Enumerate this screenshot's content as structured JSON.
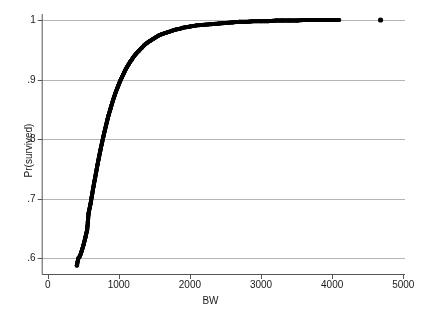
{
  "chart_data": {
    "type": "scatter",
    "title": "",
    "xlabel": "BW",
    "ylabel": "Pr(survived)",
    "xlim": [
      0,
      5000
    ],
    "ylim": [
      0.57,
      1.01
    ],
    "grid": "horizontal",
    "legend": "none",
    "marker": {
      "shape": "circle",
      "color": "#000000",
      "size": 3
    },
    "xticks": [
      {
        "value": 0,
        "label": "0"
      },
      {
        "value": 1000,
        "label": "1000"
      },
      {
        "value": 2000,
        "label": "2000"
      },
      {
        "value": 3000,
        "label": "3000"
      },
      {
        "value": 4000,
        "label": "4000"
      },
      {
        "value": 5000,
        "label": "5000"
      }
    ],
    "yticks": [
      {
        "value": 0.6,
        "label": ".6"
      },
      {
        "value": 0.7,
        "label": ".7"
      },
      {
        "value": 0.8,
        "label": ".8"
      },
      {
        "value": 0.9,
        "label": ".9"
      },
      {
        "value": 1.0,
        "label": "1"
      }
    ],
    "series": [
      {
        "name": "Pr(survived)",
        "points": [
          [
            410,
            0.588
          ],
          [
            430,
            0.6
          ],
          [
            455,
            0.604
          ],
          [
            480,
            0.613
          ],
          [
            505,
            0.623
          ],
          [
            530,
            0.635
          ],
          [
            555,
            0.648
          ],
          [
            565,
            0.662
          ],
          [
            575,
            0.676
          ],
          [
            600,
            0.69
          ],
          [
            620,
            0.704
          ],
          [
            640,
            0.718
          ],
          [
            660,
            0.731
          ],
          [
            680,
            0.744
          ],
          [
            700,
            0.757
          ],
          [
            720,
            0.769
          ],
          [
            740,
            0.781
          ],
          [
            760,
            0.792
          ],
          [
            780,
            0.803
          ],
          [
            800,
            0.813
          ],
          [
            820,
            0.823
          ],
          [
            840,
            0.833
          ],
          [
            860,
            0.842
          ],
          [
            880,
            0.85
          ],
          [
            900,
            0.858
          ],
          [
            920,
            0.866
          ],
          [
            940,
            0.873
          ],
          [
            960,
            0.88
          ],
          [
            980,
            0.886
          ],
          [
            1000,
            0.892
          ],
          [
            1020,
            0.898
          ],
          [
            1040,
            0.903
          ],
          [
            1060,
            0.908
          ],
          [
            1080,
            0.913
          ],
          [
            1100,
            0.918
          ],
          [
            1120,
            0.922
          ],
          [
            1140,
            0.926
          ],
          [
            1160,
            0.93
          ],
          [
            1180,
            0.933
          ],
          [
            1200,
            0.937
          ],
          [
            1240,
            0.943
          ],
          [
            1280,
            0.948
          ],
          [
            1320,
            0.953
          ],
          [
            1360,
            0.958
          ],
          [
            1400,
            0.962
          ],
          [
            1440,
            0.965
          ],
          [
            1480,
            0.968
          ],
          [
            1520,
            0.971
          ],
          [
            1560,
            0.974
          ],
          [
            1600,
            0.976
          ],
          [
            1650,
            0.978
          ],
          [
            1700,
            0.98
          ],
          [
            1750,
            0.982
          ],
          [
            1800,
            0.984
          ],
          [
            1850,
            0.985
          ],
          [
            1900,
            0.987
          ],
          [
            1950,
            0.988
          ],
          [
            2000,
            0.989
          ],
          [
            2100,
            0.991
          ],
          [
            2200,
            0.992
          ],
          [
            2300,
            0.993
          ],
          [
            2400,
            0.994
          ],
          [
            2500,
            0.995
          ],
          [
            2600,
            0.996
          ],
          [
            2700,
            0.997
          ],
          [
            2800,
            0.997
          ],
          [
            2900,
            0.998
          ],
          [
            3000,
            0.998
          ],
          [
            3100,
            0.998
          ],
          [
            3200,
            0.999
          ],
          [
            3300,
            0.999
          ],
          [
            3400,
            0.999
          ],
          [
            3500,
            0.999
          ],
          [
            3600,
            1.0
          ],
          [
            3700,
            1.0
          ],
          [
            3800,
            1.0
          ],
          [
            3900,
            1.0
          ],
          [
            4000,
            1.0
          ],
          [
            4100,
            1.0
          ],
          [
            4680,
            1.0
          ]
        ]
      }
    ]
  },
  "axes": {
    "y_title": "Pr(survived)",
    "x_title": "BW"
  }
}
